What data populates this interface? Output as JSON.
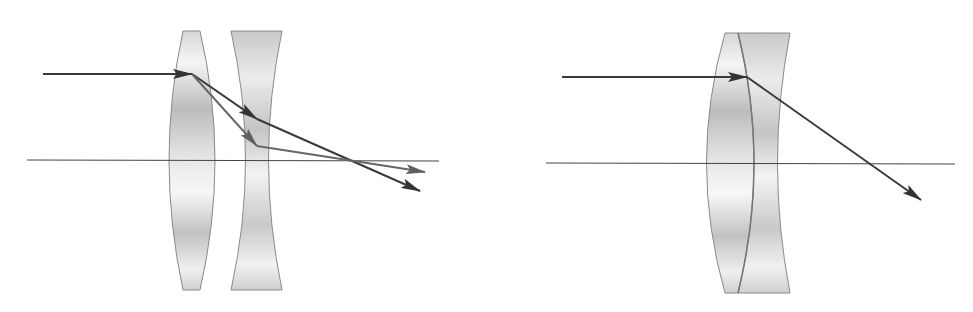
{
  "figure": {
    "colors": {
      "background": "#ffffff",
      "lens_fill_light": "#f4f4f4",
      "lens_fill_dark": "#bdbdbd",
      "lens_stroke": "#8a8a8a",
      "axis": "#444444",
      "ray_dark": "#3a3a3a",
      "ray_light": "#6a6a6a"
    },
    "left_system": {
      "optical_axis": {
        "x1": 27,
        "y1": 160,
        "x2": 439,
        "y2": 161
      },
      "incident_ray": {
        "x1": 43,
        "y1": 74,
        "x2": 192,
        "y2": 74
      },
      "converging_lens": {
        "type": "biconvex",
        "top_y": 31,
        "bottom_y": 290
      },
      "diverging_lens": {
        "type": "biconcave",
        "top_y": 31,
        "bottom_y": 290
      },
      "ray_1": [
        [
          192,
          74
        ],
        [
          257,
          119
        ],
        [
          420,
          191
        ]
      ],
      "ray_2": [
        [
          192,
          74
        ],
        [
          257,
          146
        ],
        [
          425,
          172
        ]
      ]
    },
    "right_system": {
      "optical_axis": {
        "x1": 546,
        "y1": 163,
        "x2": 955,
        "y2": 164
      },
      "incident_ray": {
        "x1": 562,
        "y1": 77,
        "x2": 747,
        "y2": 77
      },
      "doublet": {
        "type": "cemented convex + concave",
        "top_y": 33,
        "bottom_y": 293
      },
      "refracted_ray": [
        [
          747,
          77
        ],
        [
          921,
          200
        ]
      ]
    }
  }
}
